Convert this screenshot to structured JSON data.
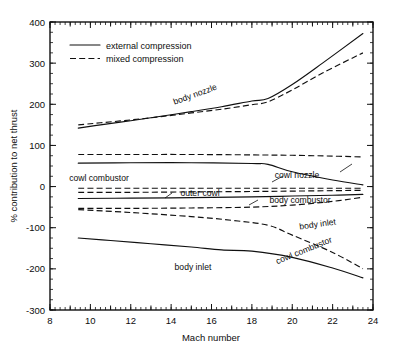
{
  "chart_data": {
    "type": "line",
    "title": "",
    "xlabel": "Mach number",
    "ylabel": "% contribution to net thrust",
    "xlim": [
      8,
      24
    ],
    "ylim": [
      -300,
      400
    ],
    "grid": false,
    "legend_position": "upper-left-inside",
    "x_ticks": [
      8,
      10,
      12,
      14,
      16,
      18,
      20,
      22,
      24
    ],
    "x_tick_labels": [
      "8",
      "10",
      "12",
      "14",
      "16",
      "18",
      "20",
      "22",
      "24"
    ],
    "x_minor_step": 0.25,
    "y_ticks": [
      -300,
      -200,
      -100,
      0,
      100,
      200,
      300,
      400
    ],
    "y_tick_labels": [
      "-300",
      "-200",
      "-100",
      "0",
      "100",
      "200",
      "300",
      "400"
    ],
    "legend": [
      {
        "label": "external compression",
        "style": "solid"
      },
      {
        "label": "mixed compression",
        "style": "dashed"
      }
    ],
    "series": [
      {
        "name": "body nozzle (external compression)",
        "style": "solid",
        "x": [
          9.4,
          10.5,
          12,
          13.5,
          15,
          16.5,
          18,
          18.8,
          20,
          21.5,
          23.5
        ],
        "values": [
          142,
          150,
          160,
          171,
          182,
          194,
          208,
          214,
          248,
          300,
          372
        ]
      },
      {
        "name": "body nozzle (mixed compression)",
        "style": "dashed",
        "x": [
          9.4,
          10.5,
          12,
          13.5,
          15,
          16.5,
          18,
          18.8,
          20,
          21.5,
          23.5
        ],
        "values": [
          150,
          155,
          162,
          170,
          179,
          188,
          199,
          206,
          235,
          276,
          325
        ]
      },
      {
        "name": "cowl nozzle (mixed compression)",
        "style": "dashed",
        "x": [
          9.4,
          12,
          15,
          18,
          20,
          22,
          23.5
        ],
        "values": [
          78,
          78,
          78,
          77,
          76,
          74,
          72
        ]
      },
      {
        "name": "cowl nozzle (external compression)",
        "style": "solid",
        "x": [
          9.4,
          12,
          15,
          18,
          18.8,
          20,
          22,
          23.5
        ],
        "values": [
          57,
          58,
          58,
          56,
          54,
          36,
          16,
          4
        ]
      },
      {
        "name": "outer cowl (mixed compression)",
        "style": "dashed",
        "x": [
          9.4,
          12,
          15,
          18,
          20,
          22,
          23.5
        ],
        "values": [
          -4,
          -4,
          -4,
          -4,
          -4,
          -4,
          -4
        ]
      },
      {
        "name": "outer cowl (external compression)",
        "style": "dashed",
        "x": [
          9.4,
          12,
          15,
          18,
          20,
          22,
          23.5
        ],
        "values": [
          -14,
          -14,
          -13,
          -12,
          -11,
          -10,
          -9
        ]
      },
      {
        "name": "body combustor (external compression)",
        "style": "solid",
        "x": [
          9.4,
          12,
          15,
          18,
          20,
          22,
          23.5
        ],
        "values": [
          -29,
          -28,
          -27,
          -25,
          -23,
          -21,
          -19
        ]
      },
      {
        "name": "body inlet (mixed compression)",
        "style": "dashed",
        "x": [
          9.4,
          12,
          15,
          18,
          20,
          22,
          23.5
        ],
        "values": [
          -53,
          -53,
          -52,
          -50,
          -45,
          -36,
          -26
        ]
      },
      {
        "name": "cowl combustor (mixed compression)",
        "style": "dashed",
        "x": [
          9.4,
          12,
          15,
          17,
          18.8,
          20,
          22,
          23.5
        ],
        "values": [
          -56,
          -63,
          -73,
          -82,
          -94,
          -118,
          -160,
          -200
        ]
      },
      {
        "name": "body inlet (external compression)",
        "style": "solid",
        "x": [
          9.4,
          11,
          13,
          15,
          16.5,
          18,
          20,
          22,
          23.5
        ],
        "values": [
          -125,
          -131,
          -139,
          -147,
          -154,
          -157,
          -172,
          -198,
          -222
        ]
      }
    ],
    "annotations": [
      {
        "text": "body nozzle",
        "x_px": 196,
        "y_px": 97,
        "rotation": -20,
        "leader": false
      },
      {
        "text": "cowl nozzle",
        "x_px": 297,
        "y_px": 178,
        "rotation": 0,
        "leader": true
      },
      {
        "text": "outer cowl",
        "x_px": 200,
        "y_px": 196,
        "rotation": 0,
        "leader": true
      },
      {
        "text": "cowl combustor",
        "x_px": 99,
        "y_px": 181,
        "rotation": 0,
        "leader": false
      },
      {
        "text": "body combustor",
        "x_px": 300,
        "y_px": 203,
        "rotation": 0,
        "leader": true
      },
      {
        "text": "body inlet",
        "x_px": 318,
        "y_px": 227,
        "rotation": -8,
        "leader": false
      },
      {
        "text": "cowl combustor",
        "x_px": 305,
        "y_px": 253,
        "rotation": -22,
        "leader": false
      },
      {
        "text": "body inlet",
        "x_px": 193,
        "y_px": 270,
        "rotation": 0,
        "leader": false
      }
    ]
  }
}
